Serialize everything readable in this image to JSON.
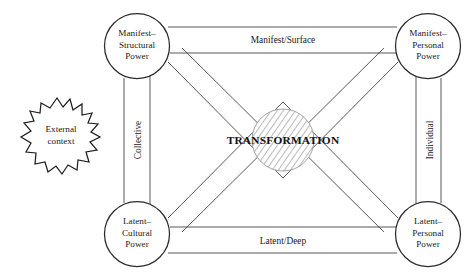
{
  "figure": {
    "title_fragment": "",
    "center": {
      "label": "TRANSFORMATION"
    },
    "external": {
      "line1": "External",
      "line2": "context"
    },
    "nodes": [
      {
        "id": "manifest-structural",
        "line1": "Manifest–",
        "line2": "Structural",
        "line3": "Power",
        "cx": 137,
        "cy": 46
      },
      {
        "id": "manifest-personal",
        "line1": "Manifest–",
        "line2": "Personal",
        "line3": "Power",
        "cx": 428,
        "cy": 46
      },
      {
        "id": "latent-cultural",
        "line1": "Latent–",
        "line2": "Cultural",
        "line3": "Power",
        "cx": 137,
        "cy": 234
      },
      {
        "id": "latent-personal",
        "line1": "Latent–",
        "line2": "Personal",
        "line3": "Power",
        "cx": 428,
        "cy": 234
      }
    ],
    "edges": [
      {
        "id": "top",
        "label": "Manifest/Surface"
      },
      {
        "id": "bottom",
        "label": "Latent/Deep"
      },
      {
        "id": "left",
        "label": "Collective"
      },
      {
        "id": "right",
        "label": "Individual"
      }
    ],
    "colors": {
      "stroke": "#3a3a3a",
      "center_hatch": "#b9b9b9",
      "text": "#1a1a1a",
      "background": "#ffffff"
    }
  }
}
